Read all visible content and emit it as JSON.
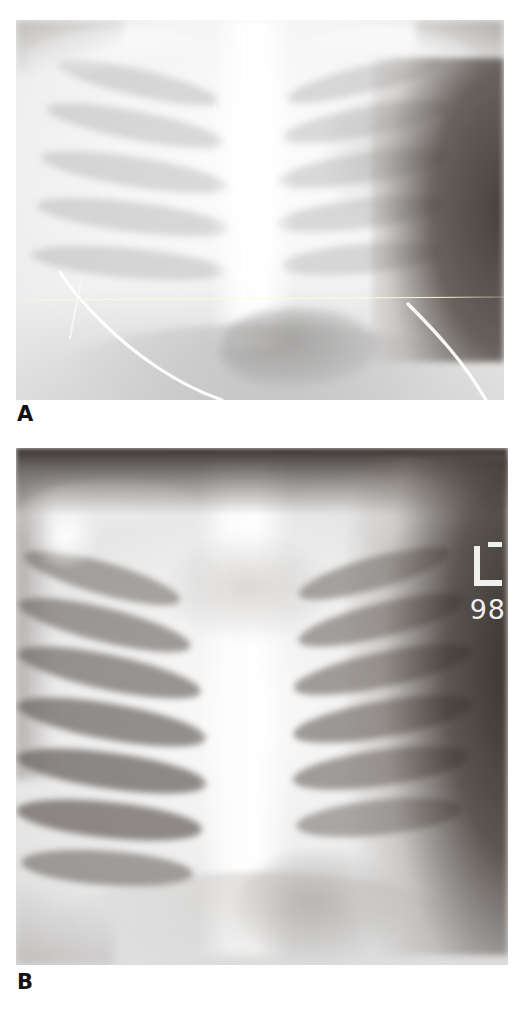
{
  "figure": {
    "type": "medical-radiograph-figure",
    "modality": "X-ray",
    "view": "chest anteroposterior",
    "panel_count": 2,
    "background_color": "#ffffff"
  },
  "panels": [
    {
      "id": "A",
      "caption": "A",
      "description": "Overexposed / high-brightness neonatal chest radiograph showing faint rib outlines, central spine column, dark soft-tissue background at right, and curved radiopaque catheter tubing crossing the lower field.",
      "exposure": "overexposed",
      "contrast": "low",
      "annotations": [
        {
          "name": "horizontal-reference-line",
          "kind": "thin-line",
          "color": "#fdfbd6",
          "orientation": "horizontal"
        },
        {
          "name": "catheter-line",
          "kind": "curved-tube",
          "color": "#ffffff"
        }
      ],
      "rect": {
        "x": 16,
        "y": 20,
        "w": 488,
        "h": 380
      }
    },
    {
      "id": "B",
      "caption": "B",
      "description": "Higher-contrast neonatal chest radiograph of the same region showing clearly delineated ribs with dark intercostal spaces, bright mediastinum, and a radiopaque left-side marker at the right edge.",
      "exposure": "normal",
      "contrast": "high",
      "annotations": [
        {
          "name": "side-marker",
          "kind": "radiopaque-L-marker",
          "label": "L",
          "color": "#f0f0ee"
        },
        {
          "name": "marker-digits",
          "kind": "radiopaque-digits",
          "label": "98",
          "color": "#eeeeec"
        }
      ],
      "rect": {
        "x": 16,
        "y": 448,
        "w": 492,
        "h": 517
      }
    }
  ],
  "marker": {
    "side_label": "L",
    "digits": "98"
  },
  "colors": {
    "page_background": "#ffffff",
    "caption_text": "#121212",
    "bone_bright": "#fbfbfb",
    "soft_tissue_dark": "#3a322e",
    "marker": "#f0f0ee",
    "reference_line": "#fdfbd6"
  }
}
